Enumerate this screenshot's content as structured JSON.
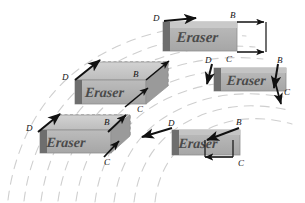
{
  "figure": {
    "background_color": "#ffffff",
    "ink_color": "#111111",
    "trajectory_color": "#cfcfcf",
    "eraser_face_color": "#b0b0b0",
    "eraser_top_color": "#c8c8c8",
    "eraser_side_color": "#8a8a8a",
    "eraser_cap_color": "#6e6e6e",
    "eraser_label": "Eraser",
    "axis_labels": {
      "b": "B",
      "c": "C",
      "d": "D"
    }
  },
  "erasers": [
    {
      "id": "eraser-top",
      "position": "top-center-right",
      "label": "Eraser",
      "labels": [
        {
          "axis": "D",
          "x": 153,
          "y": 16
        },
        {
          "axis": "B",
          "x": 230,
          "y": 13
        },
        {
          "axis": "C",
          "x": 228,
          "y": 58
        }
      ]
    },
    {
      "id": "eraser-middle-left",
      "position": "middle-left",
      "label": "Eraser",
      "labels": [
        {
          "axis": "D",
          "x": 62,
          "y": 74
        },
        {
          "axis": "B",
          "x": 131,
          "y": 70
        },
        {
          "axis": "C",
          "x": 137,
          "y": 104
        }
      ]
    },
    {
      "id": "eraser-middle-right",
      "position": "middle-right",
      "label": "Eraser",
      "labels": [
        {
          "axis": "D",
          "x": 205,
          "y": 59
        },
        {
          "axis": "C",
          "x": 226,
          "y": 57
        },
        {
          "axis": "B",
          "x": 273,
          "y": 59
        },
        {
          "axis": "C2",
          "x": 283,
          "y": 89
        }
      ]
    },
    {
      "id": "eraser-bottom-left",
      "position": "bottom-left",
      "label": "Eraser",
      "labels": [
        {
          "axis": "D",
          "x": 26,
          "y": 124
        },
        {
          "axis": "B",
          "x": 103,
          "y": 119
        },
        {
          "axis": "C",
          "x": 103,
          "y": 157
        }
      ]
    },
    {
      "id": "eraser-bottom-middle",
      "position": "bottom-center",
      "label": "Eraser",
      "labels": [
        {
          "axis": "D",
          "x": 168,
          "y": 121
        },
        {
          "axis": "B",
          "x": 234,
          "y": 120
        },
        {
          "axis": "C",
          "x": 236,
          "y": 160
        }
      ]
    }
  ],
  "trajectories": {
    "description": "faint gray dashed concentric arcs sweeping from lower-left to upper-right",
    "count": 9
  }
}
